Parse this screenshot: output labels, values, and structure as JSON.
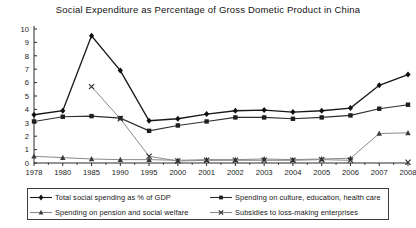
{
  "chart_data": {
    "type": "line",
    "title": "Social Expenditure as Percentage of Gross Dometic Product in China",
    "xlabel": "",
    "ylabel": "",
    "ylim": [
      0,
      10
    ],
    "ytick_labels": [
      "0",
      "1",
      "2",
      "3",
      "4",
      "5",
      "6",
      "7",
      "8",
      "9",
      "10"
    ],
    "ytick_values": [
      0,
      1,
      2,
      3,
      4,
      5,
      6,
      7,
      8,
      9,
      10
    ],
    "grid": false,
    "legend_position": "bottom",
    "categories": [
      "1978",
      "1980",
      "1985",
      "1990",
      "1995",
      "2000",
      "2001",
      "2002",
      "2003",
      "2004",
      "2005",
      "2006",
      "2007",
      "2008"
    ],
    "series": [
      {
        "name": "Total social spending as % of GDP",
        "marker": "diamond",
        "values": [
          3.6,
          3.9,
          9.5,
          6.9,
          3.15,
          3.3,
          3.65,
          3.9,
          3.95,
          3.8,
          3.9,
          4.1,
          5.8,
          6.6
        ]
      },
      {
        "name": "Spending on culture, education, health care",
        "marker": "square",
        "values": [
          3.1,
          3.45,
          3.5,
          3.35,
          2.4,
          2.8,
          3.1,
          3.4,
          3.4,
          3.3,
          3.4,
          3.55,
          4.05,
          4.35
        ]
      },
      {
        "name": "Spending on pension and social welfare",
        "marker": "triangle",
        "values": [
          0.5,
          0.4,
          0.3,
          0.25,
          0.25,
          0.2,
          0.25,
          0.25,
          0.3,
          0.25,
          0.3,
          0.35,
          2.2,
          2.25
        ]
      },
      {
        "name": "Subsidies to loss-making enterprises",
        "marker": "cross",
        "values": [
          null,
          null,
          5.7,
          3.3,
          0.5,
          0.15,
          0.2,
          0.2,
          0.2,
          0.2,
          0.25,
          0.2,
          null,
          0.05
        ]
      }
    ]
  },
  "legend": {
    "items": [
      {
        "label": "Total social spending as % of GDP",
        "marker": "diamond"
      },
      {
        "label": "Spending on culture, education, health care",
        "marker": "square"
      },
      {
        "label": "Spending on pension and social welfare",
        "marker": "triangle"
      },
      {
        "label": "Subsidies to loss-making enterprises",
        "marker": "cross"
      }
    ]
  }
}
